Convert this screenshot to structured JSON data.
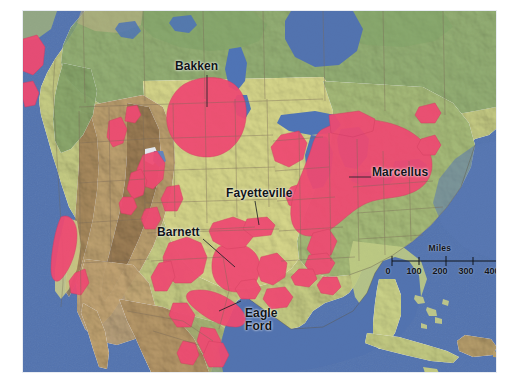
{
  "figure": {
    "caption_fragment": "",
    "background": "#ffffff"
  },
  "map": {
    "title": "Major U.S. Shale Plays",
    "projection_note": "North America, shaded relief base",
    "colors": {
      "ocean": "#5273b0",
      "lake": "#4f74b6",
      "shale_play": "#ef4a72",
      "lowland_green": "#b9c87c",
      "plains_yellow": "#d9d98d",
      "highland_tan": "#c0a371",
      "mountain_brown": "#9a7a52",
      "forest_green": "#8fae74",
      "border_line": "#7a6a58",
      "coastline": "#6e6450"
    },
    "labels": [
      {
        "id": "bakken",
        "name": "Bakken",
        "text": "Bakken"
      },
      {
        "id": "marcellus",
        "name": "Marcellus",
        "text": "Marcellus"
      },
      {
        "id": "fayetteville",
        "name": "Fayetteville",
        "text": "Fayetteville"
      },
      {
        "id": "barnett",
        "name": "Barnett",
        "text": "Barnett"
      },
      {
        "id": "eagleford",
        "name": "Eagle Ford",
        "text": "Eagle\nFord"
      }
    ],
    "scalebar": {
      "units_label": "Miles",
      "ticks": [
        "0",
        "100",
        "200",
        "300",
        "400"
      ],
      "min": 0,
      "max": 400
    }
  }
}
